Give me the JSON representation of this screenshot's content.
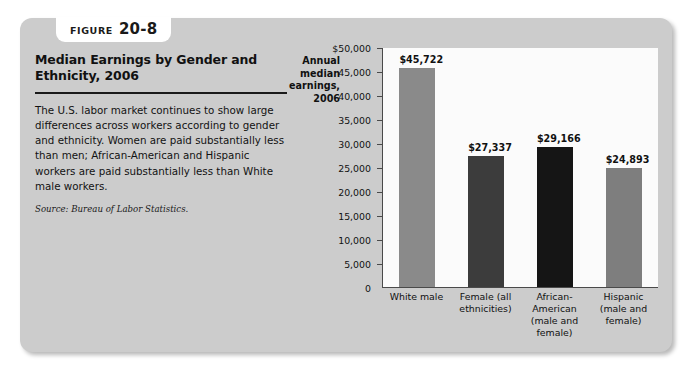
{
  "figure": {
    "label_word": "Figure",
    "number": "20-8"
  },
  "panel": {
    "title": "Median Earnings by Gender and Ethnicity, 2006",
    "description": "The U.S. labor market continues to show large differences across workers according to gender and ethnicity. Women are paid substantially less than men; African-American and Hispanic workers are paid substantially less than White male workers.",
    "source": "Source: Bureau of Labor Statistics."
  },
  "axis_caption": "Annual median earnings, 2006",
  "chart_data": {
    "type": "bar",
    "title": "Median Earnings by Gender and Ethnicity, 2006",
    "xlabel": "",
    "ylabel": "Annual median earnings, 2006",
    "categories": [
      "White male",
      "Female (all ethnicities)",
      "African-American (male and female)",
      "Hispanic (male and female)"
    ],
    "values": [
      45722,
      27337,
      29166,
      24893
    ],
    "value_labels": [
      "$45,722",
      "$27,337",
      "$29,166",
      "$24,893"
    ],
    "bar_colors": [
      "#8a8a8a",
      "#3c3c3c",
      "#151515",
      "#7e7e7e"
    ],
    "ylim": [
      0,
      50000
    ],
    "ytick_values": [
      0,
      5000,
      10000,
      15000,
      20000,
      25000,
      30000,
      35000,
      40000,
      45000,
      50000
    ],
    "ytick_labels": [
      "0",
      "5,000",
      "10,000",
      "15,000",
      "20,000",
      "25,000",
      "30,000",
      "35,000",
      "40,000",
      "45,000",
      "$50,000"
    ],
    "grid": false,
    "legend": "none"
  },
  "colors": {
    "card_background": "#cccccc",
    "plot_background": "#fbfbfb",
    "axis": "#4a4a4a",
    "text": "#111111"
  }
}
